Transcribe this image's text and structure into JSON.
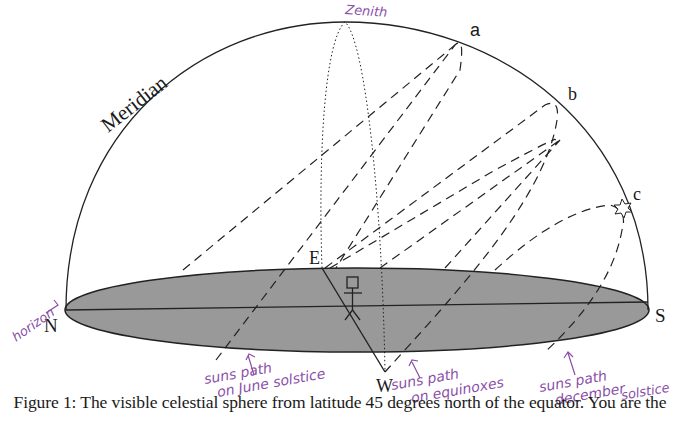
{
  "figure": {
    "labels": {
      "meridian": "Meridian",
      "zenith": "Zenith",
      "north": "N",
      "south": "S",
      "east": "E",
      "west": "W",
      "point_a": "a",
      "point_b": "b",
      "point_c": "c"
    },
    "annotations": {
      "horizon": "horizon",
      "june_line1": "suns path",
      "june_line2": "on June solstice",
      "equinox_line1": "suns path",
      "equinox_line2": "on equinoxes",
      "december_line1": "suns path",
      "december_line2": "december",
      "december_line3": "solstice"
    },
    "colors": {
      "horizon_fill": "#999999",
      "line": "#222222",
      "annotation": "#8a4fa8"
    },
    "caption": "Figure 1: The visible celestial sphere from latitude 45 degrees north of the equator. You are the"
  }
}
